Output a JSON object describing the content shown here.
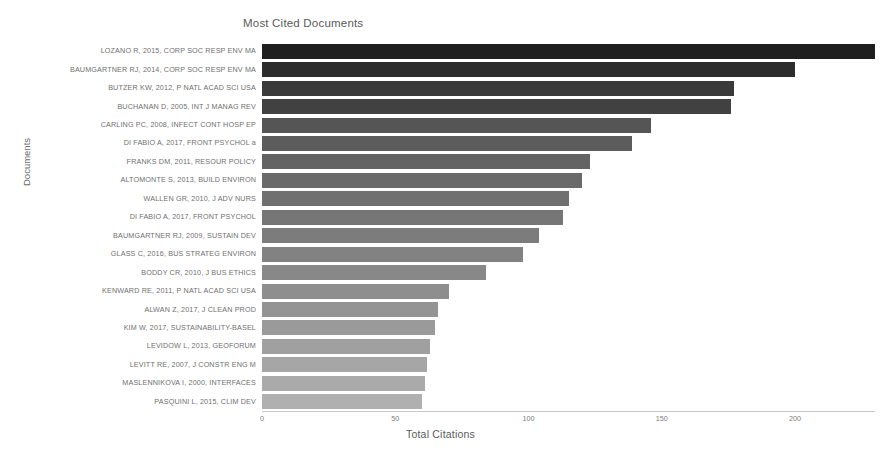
{
  "chart_data": {
    "type": "bar",
    "orientation": "horizontal",
    "title": "Most Cited Documents",
    "xlabel": "Total Citations",
    "ylabel": "Documents",
    "xlim": [
      0,
      230
    ],
    "xticks": [
      0,
      50,
      100,
      150,
      200
    ],
    "xtick_labels": [
      "0",
      "50",
      "100",
      "150",
      "200"
    ],
    "grid": false,
    "legend": false,
    "categories": [
      "LOZANO R, 2015, CORP SOC RESP ENV MA",
      "BAUMGARTNER RJ, 2014, CORP SOC RESP ENV MA",
      "BUTZER KW, 2012, P NATL ACAD SCI USA",
      "BUCHANAN D, 2005, INT J MANAG REV",
      "CARLING PC, 2008, INFECT CONT HOSP EP",
      "DI FABIO A, 2017, FRONT PSYCHOL a",
      "FRANKS DM, 2011, RESOUR POLICY",
      "ALTOMONTE S, 2013, BUILD ENVIRON",
      "WALLEN GR, 2010, J ADV NURS",
      "DI FABIO A, 2017, FRONT PSYCHOL",
      "BAUMGARTNER RJ, 2009, SUSTAIN DEV",
      "GLASS C, 2016, BUS STRATEG ENVIRON",
      "BODDY CR, 2010, J BUS ETHICS",
      "KENWARD RE, 2011, P NATL ACAD SCI USA",
      "ALWAN Z, 2017, J CLEAN PROD",
      "KIM W, 2017, SUSTAINABILITY-BASEL",
      "LEVIDOW L, 2013, GEOFORUM",
      "LEVITT RE, 2007, J CONSTR ENG M",
      "MASLENNIKOVA I, 2000, INTERFACES",
      "PASQUINI L, 2015, CLIM DEV"
    ],
    "values": [
      230,
      200,
      177,
      176,
      146,
      139,
      123,
      120,
      115,
      113,
      104,
      98,
      84,
      70,
      66,
      65,
      63,
      62,
      61,
      60
    ],
    "bar_colors": [
      "#1f1f1f",
      "#2d2d2d",
      "#3a3a3a",
      "#414141",
      "#555555",
      "#5c5c5c",
      "#636363",
      "#6a6a6a",
      "#707070",
      "#767676",
      "#7c7c7c",
      "#828282",
      "#888888",
      "#8e8e8e",
      "#949494",
      "#9a9a9a",
      "#a0a0a0",
      "#a6a6a6",
      "#abaaab",
      "#b0b0b0"
    ]
  }
}
